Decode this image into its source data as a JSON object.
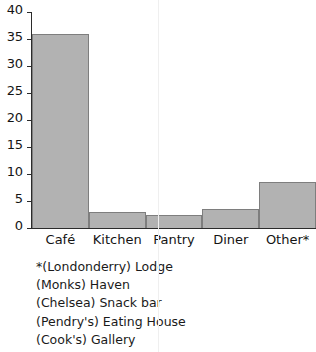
{
  "chart_data": {
    "type": "bar",
    "title": "",
    "xlabel": "",
    "ylabel": "",
    "categories": [
      "Café",
      "Kitchen",
      "Pantry",
      "Diner",
      "Other*"
    ],
    "values": [
      36,
      3,
      2.5,
      3.5,
      8.5
    ],
    "ylim": [
      0,
      40
    ],
    "yticks": [
      0,
      5,
      10,
      15,
      20,
      25,
      30,
      35,
      40
    ],
    "ytick_labels": [
      "0",
      "5",
      "10",
      "15",
      "20",
      "25",
      "30",
      "35",
      "40"
    ],
    "grid": false,
    "legend": null,
    "bar_color": "#b2b2b2",
    "bar_edge_color": "#7e7e7e",
    "axis_color": "#2b2b2b",
    "background_color": "#ffffff",
    "bar_gap": "none"
  },
  "footnote": {
    "lines": [
      "*(Londonderry) Lodge",
      "(Monks) Haven",
      "(Chelsea) Snack bar",
      "(Pendry's) Eating House",
      "(Cook's) Gallery"
    ]
  }
}
